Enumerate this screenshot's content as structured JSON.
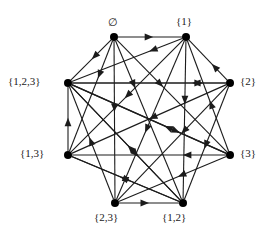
{
  "figure": {
    "kind": "directed-graph",
    "width": 270,
    "height": 236,
    "background_color": "#ffffff",
    "edge_color": "#1c1c1c",
    "node_color": "#000000",
    "node_radius": 4
  },
  "nodes": [
    {
      "id": "empty",
      "label": "∅",
      "x": 114,
      "y": 37,
      "label_x": 108,
      "label_y": 16,
      "label_align": "left"
    },
    {
      "id": "s1",
      "label": "{1}",
      "x": 186,
      "y": 37,
      "label_x": 176,
      "label_y": 15,
      "label_align": "left"
    },
    {
      "id": "s123",
      "label": "{1,2,3}",
      "x": 68,
      "y": 83,
      "label_x": 8,
      "label_y": 75,
      "label_align": "left"
    },
    {
      "id": "s2",
      "label": "{2}",
      "x": 230,
      "y": 83,
      "label_x": 240,
      "label_y": 75,
      "label_align": "left"
    },
    {
      "id": "s13",
      "label": "{1,3}",
      "x": 68,
      "y": 155,
      "label_x": 20,
      "label_y": 147,
      "label_align": "left"
    },
    {
      "id": "s3",
      "label": "{3}",
      "x": 230,
      "y": 155,
      "label_x": 240,
      "label_y": 147,
      "label_align": "left"
    },
    {
      "id": "s23",
      "label": "{2,3}",
      "x": 115,
      "y": 203,
      "label_x": 94,
      "label_y": 211,
      "label_align": "left"
    },
    {
      "id": "s12",
      "label": "{1,2}",
      "x": 183,
      "y": 203,
      "label_x": 162,
      "label_y": 211,
      "label_align": "left"
    }
  ],
  "edges": [
    {
      "from": "empty",
      "to": "s1",
      "arrow_t": 0.55
    },
    {
      "from": "empty",
      "to": "s123",
      "arrow_t": 0.48
    },
    {
      "from": "empty",
      "to": "s13",
      "arrow_t": 0.34
    },
    {
      "from": "empty",
      "to": "s23",
      "arrow_t": 0.45
    },
    {
      "from": "empty",
      "to": "s12",
      "arrow_t": 0.3
    },
    {
      "from": "empty",
      "to": "s3",
      "arrow_t": 0.42
    },
    {
      "from": "s1",
      "to": "s123",
      "arrow_t": 0.3
    },
    {
      "from": "s1",
      "to": "s13",
      "arrow_t": 0.52
    },
    {
      "from": "s1",
      "to": "s12",
      "arrow_t": 0.4
    },
    {
      "from": "s1",
      "to": "s23",
      "arrow_t": 0.58
    },
    {
      "from": "s2",
      "to": "s123",
      "arrow_t": 0.22
    },
    {
      "from": "s2",
      "to": "s1",
      "arrow_t": 0.4
    },
    {
      "from": "s2",
      "to": "s23",
      "arrow_t": 0.42
    },
    {
      "from": "s2",
      "to": "s12",
      "arrow_t": 0.55
    },
    {
      "from": "s2",
      "to": "s13",
      "arrow_t": 0.5
    },
    {
      "from": "s13",
      "to": "s123",
      "arrow_t": 0.52
    },
    {
      "from": "s13",
      "to": "s12",
      "arrow_t": 0.55
    },
    {
      "from": "s3",
      "to": "s13",
      "arrow_t": 0.28
    },
    {
      "from": "s3",
      "to": "s123",
      "arrow_t": 0.4
    },
    {
      "from": "s3",
      "to": "s23",
      "arrow_t": 0.45
    },
    {
      "from": "s3",
      "to": "s1",
      "arrow_t": 0.46
    },
    {
      "from": "s23",
      "to": "s123",
      "arrow_t": 0.55
    },
    {
      "from": "s23",
      "to": "s12",
      "arrow_t": 0.5
    },
    {
      "from": "s12",
      "to": "s123",
      "arrow_t": 0.48
    },
    {
      "from": "s12",
      "to": "s13",
      "arrow_t": 0.55
    },
    {
      "from": "s123",
      "to": "s2",
      "arrow_t": 0.85
    },
    {
      "from": "s123",
      "to": "s3",
      "arrow_t": 0.7
    },
    {
      "from": "s123",
      "to": "s12",
      "arrow_t": 0.62
    }
  ]
}
